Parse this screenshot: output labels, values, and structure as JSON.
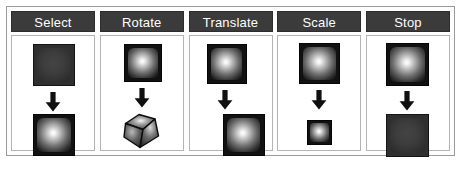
{
  "figure": {
    "type": "interaction-mode-legend",
    "panel_count": 5,
    "colors": {
      "header_background": "#3b3b3b",
      "header_text": "#ffffff",
      "panel_border": "#b4b4b4",
      "frame_border": "#9a9a9a",
      "cube_outline": "#050505",
      "cube_unselected": "#2f2f2f",
      "cube_highlight": "#ffffff",
      "page_background": "#ffffff"
    },
    "panels": [
      {
        "id": "select",
        "label": "Select",
        "before": {
          "icon": "cube-unselected-icon",
          "state": "dark",
          "size": "normal",
          "shape": "square"
        },
        "transition_icon": "arrow-down-icon",
        "after": {
          "icon": "cube-highlighted-icon",
          "state": "lit",
          "size": "normal",
          "shape": "square"
        }
      },
      {
        "id": "rotate",
        "label": "Rotate",
        "before": {
          "icon": "cube-highlighted-icon",
          "state": "lit",
          "size": "normal",
          "shape": "square"
        },
        "transition_icon": "arrow-down-icon",
        "after": {
          "icon": "cube-rotated-icon",
          "state": "lit",
          "size": "normal",
          "shape": "rotated-cube"
        }
      },
      {
        "id": "translate",
        "label": "Translate",
        "before": {
          "icon": "cube-highlighted-icon",
          "state": "lit",
          "size": "normal",
          "shape": "square"
        },
        "transition_icon": "arrow-down-icon",
        "after": {
          "icon": "cube-translated-icon",
          "state": "lit",
          "size": "normal",
          "shape": "square-offset-right"
        }
      },
      {
        "id": "scale",
        "label": "Scale",
        "before": {
          "icon": "cube-highlighted-icon",
          "state": "lit",
          "size": "normal",
          "shape": "square"
        },
        "transition_icon": "arrow-down-icon",
        "after": {
          "icon": "cube-scaled-down-icon",
          "state": "lit",
          "size": "small",
          "shape": "square"
        }
      },
      {
        "id": "stop",
        "label": "Stop",
        "before": {
          "icon": "cube-highlighted-icon",
          "state": "lit",
          "size": "normal",
          "shape": "square"
        },
        "transition_icon": "arrow-down-icon",
        "after": {
          "icon": "cube-unselected-icon",
          "state": "dark",
          "size": "normal",
          "shape": "square"
        }
      }
    ]
  }
}
